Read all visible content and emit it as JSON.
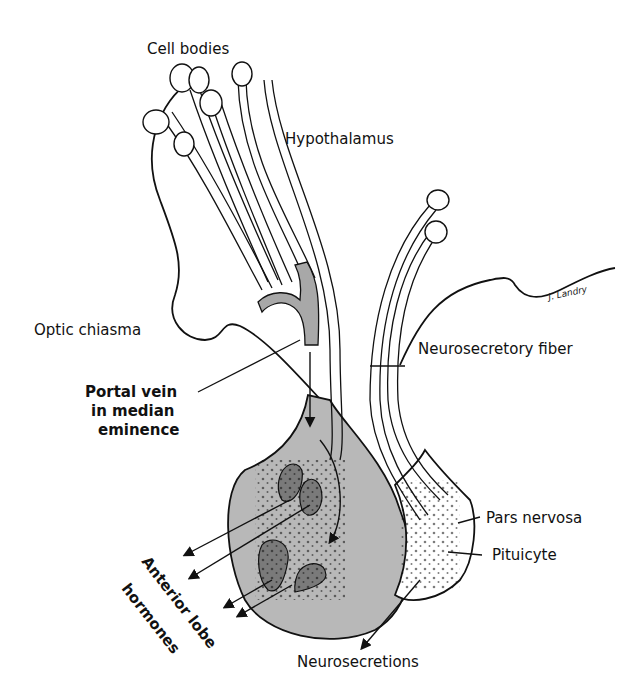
{
  "diagram": {
    "labels": {
      "cell_bodies": "Cell bodies",
      "hypothalamus": "Hypothalamus",
      "optic_chiasma": "Optic chiasma",
      "portal_vein_line1": "Portal vein",
      "portal_vein_line2": "in median",
      "portal_vein_line3": "eminence",
      "neurosecretory_fiber": "Neurosecretory fiber",
      "pars_nervosa": "Pars nervosa",
      "pituicyte": "Pituicyte",
      "anterior_lobe_line1": "Anterior lobe",
      "anterior_lobe_line2": "hormones",
      "neurosecretions": "Neurosecretions"
    },
    "signature": "J. Landry",
    "colors": {
      "line": "#111111",
      "anterior_lobe_fill": "#b8b8b8",
      "cell_fill": "#7a7a7a",
      "vein_fill": "#a8a8a8"
    }
  }
}
